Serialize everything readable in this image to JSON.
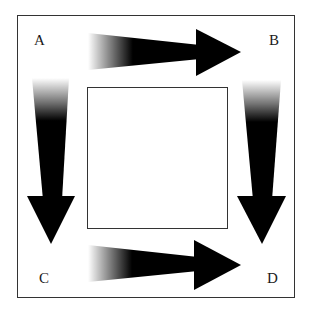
{
  "diagram": {
    "labels": {
      "a": "A",
      "b": "B",
      "c": "C",
      "d": "D"
    },
    "colors": {
      "ink": "#000000",
      "border": "#333333",
      "background": "#ffffff"
    },
    "arrows": [
      {
        "from": "A",
        "to": "B",
        "direction": "right"
      },
      {
        "from": "A",
        "to": "C",
        "direction": "down"
      },
      {
        "from": "B",
        "to": "D",
        "direction": "down"
      },
      {
        "from": "C",
        "to": "D",
        "direction": "right"
      }
    ]
  }
}
